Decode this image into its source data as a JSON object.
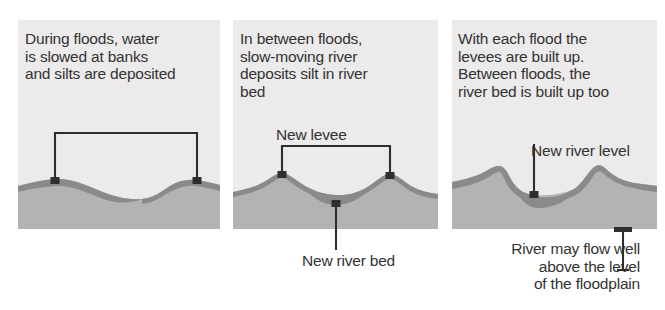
{
  "diagram": {
    "colors": {
      "panel_background": "#eceaea",
      "soil": "#b3b3b3",
      "silt": "#8a8a8a",
      "ink": "#2e2e2e",
      "text": "#333333",
      "page_background": "#ffffff"
    }
  },
  "panels": [
    {
      "id": "panel-1",
      "caption": "During floods, water\nis slowed at banks\nand silts are deposited",
      "annotations": [
        {
          "id": "flood-span-bracket",
          "name": "bank-span-bracket",
          "text": ""
        }
      ]
    },
    {
      "id": "panel-2",
      "caption": "In between floods,\nslow-moving river\ndeposits silt in river\nbed",
      "annotations": [
        {
          "id": "new-levee",
          "name": "new-levee-label",
          "text": "New levee"
        },
        {
          "id": "new-river-bed",
          "name": "new-river-bed-label",
          "text": "New river bed"
        }
      ]
    },
    {
      "id": "panel-3",
      "caption": "With each flood the\nlevees are built up.\nBetween floods, the\nriver bed is built up too",
      "annotations": [
        {
          "id": "new-river-level",
          "name": "new-river-level-label",
          "text": "New river level"
        },
        {
          "id": "river-above-floodplain",
          "name": "river-above-floodplain-label",
          "text": "River may flow well\nabove the level\nof the floodplain"
        }
      ]
    }
  ]
}
